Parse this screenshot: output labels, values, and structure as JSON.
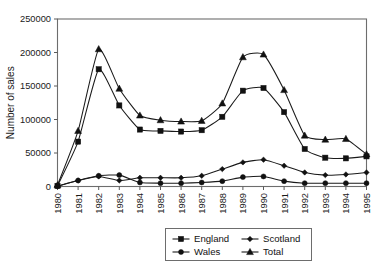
{
  "chart_data": {
    "type": "line",
    "title": "",
    "xlabel": "",
    "ylabel": "Number of sales",
    "ylim": [
      0,
      250000
    ],
    "ytick_values": [
      0,
      50000,
      100000,
      150000,
      200000,
      250000
    ],
    "ytick_labels": [
      "0",
      "50000",
      "100000",
      "150000",
      "200000",
      "250000"
    ],
    "grid": false,
    "legend_position": "bottom",
    "categories": [
      "1980",
      "1981",
      "1982",
      "1983",
      "1984",
      "1985",
      "1986",
      "1987",
      "1988",
      "1989",
      "1990",
      "1991",
      "1992",
      "1993",
      "1994",
      "1995"
    ],
    "series": [
      {
        "name": "England",
        "marker": "square",
        "values": [
          1000,
          67000,
          175000,
          121000,
          85000,
          83000,
          82000,
          84000,
          104000,
          143000,
          147000,
          111000,
          56000,
          43000,
          42000,
          45000
        ]
      },
      {
        "name": "Scotland",
        "marker": "diamond",
        "values": [
          700,
          9000,
          15000,
          9000,
          13000,
          13000,
          13000,
          16000,
          26000,
          36000,
          40000,
          31000,
          21000,
          17000,
          18000,
          21000
        ]
      },
      {
        "name": "Wales",
        "marker": "circle",
        "values": [
          400,
          9000,
          16000,
          17000,
          6000,
          5000,
          5000,
          6000,
          8000,
          14000,
          15000,
          8000,
          5000,
          5000,
          5000,
          5000
        ]
      },
      {
        "name": "Total",
        "marker": "triangle",
        "values": [
          2000,
          83000,
          205000,
          146000,
          106000,
          99000,
          97000,
          98000,
          124000,
          193000,
          197000,
          144000,
          76000,
          70000,
          71000,
          48000
        ]
      }
    ]
  },
  "axes": {
    "y_axis_title": "Number of sales"
  },
  "legend": {
    "entries": [
      {
        "label": "England",
        "marker": "square"
      },
      {
        "label": "Scotland",
        "marker": "diamond"
      },
      {
        "label": "Wales",
        "marker": "circle"
      },
      {
        "label": "Total",
        "marker": "triangle"
      }
    ]
  }
}
